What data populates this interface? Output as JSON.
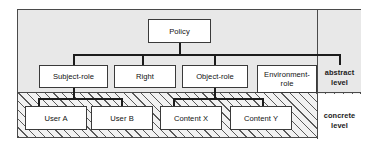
{
  "diagram": {
    "type": "hierarchy-tree",
    "bands": [
      {
        "id": "abstract",
        "label_line1": "abstract",
        "label_line2": "level",
        "fill": "#e8e8e8",
        "pattern": "solid"
      },
      {
        "id": "concrete",
        "label_line1": "concrete",
        "label_line2": "level",
        "fill": "#f2f2f2",
        "pattern": "diagonal-hatch"
      }
    ],
    "nodes": [
      {
        "id": "policy",
        "label": "Policy",
        "level": "abstract"
      },
      {
        "id": "subject-role",
        "label": "Subject-role",
        "level": "abstract"
      },
      {
        "id": "right",
        "label": "Right",
        "level": "abstract"
      },
      {
        "id": "object-role",
        "label": "Object-role",
        "level": "abstract"
      },
      {
        "id": "environment-role",
        "label_line1": "Environment-",
        "label_line2": "role",
        "level": "abstract"
      },
      {
        "id": "user-a",
        "label": "User A",
        "level": "concrete"
      },
      {
        "id": "user-b",
        "label": "User B",
        "level": "concrete"
      },
      {
        "id": "content-x",
        "label": "Content X",
        "level": "concrete"
      },
      {
        "id": "content-y",
        "label": "Content Y",
        "level": "concrete"
      }
    ],
    "edges": [
      {
        "from": "policy",
        "to": "subject-role"
      },
      {
        "from": "policy",
        "to": "right"
      },
      {
        "from": "policy",
        "to": "object-role"
      },
      {
        "from": "policy",
        "to": "environment-role"
      },
      {
        "from": "subject-role",
        "to": "user-a"
      },
      {
        "from": "subject-role",
        "to": "user-b"
      },
      {
        "from": "object-role",
        "to": "content-x"
      },
      {
        "from": "object-role",
        "to": "content-y"
      }
    ],
    "colors": {
      "border": "#3a3a3a",
      "line": "#1c1c1c",
      "abstract_fill": "#e8e8e8",
      "concrete_fill": "#f2f2f2",
      "node_fill": "#ffffff",
      "text": "#111111"
    }
  }
}
